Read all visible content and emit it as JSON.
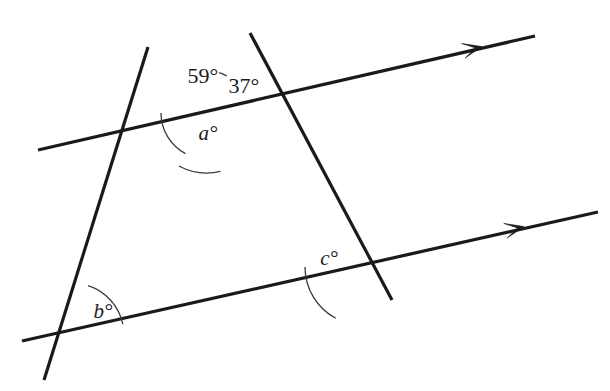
{
  "diagram": {
    "background_color": "#ffffff",
    "line_color": "#1a1a1a",
    "arc_color": "#3a3a3a",
    "width": 610,
    "height": 391,
    "lines": [
      {
        "name": "upper-parallel-line",
        "x1": 38,
        "y1": 150,
        "x2": 535,
        "y2": 36,
        "arrow_at": {
          "x": 480,
          "y": 47
        },
        "arrow_count": 1
      },
      {
        "name": "lower-parallel-line",
        "x1": 22,
        "y1": 341,
        "x2": 598,
        "y2": 212,
        "arrow_at": {
          "x": 522,
          "y": 227
        },
        "arrow_count": 1
      },
      {
        "name": "left-transversal-line",
        "x1": 148,
        "y1": 47,
        "x2": 44,
        "y2": 380,
        "arrow_at": null,
        "arrow_count": 0
      },
      {
        "name": "right-transversal-line",
        "x1": 250,
        "y1": 33,
        "x2": 392,
        "y2": 300,
        "arrow_at": null,
        "arrow_count": 0
      }
    ],
    "vertices": [
      {
        "name": "top-intersection",
        "x": 207,
        "y": 113
      },
      {
        "name": "bottom-left-intersection",
        "x": 72,
        "y": 335
      },
      {
        "name": "bottom-right-intersection",
        "x": 363,
        "y": 267
      }
    ],
    "angles": [
      {
        "name": "angle-59",
        "label": "59°",
        "value": 59,
        "kind": "numeric",
        "label_x": 203,
        "label_y": 78,
        "vertex": {
          "x": 207,
          "y": 113
        },
        "arc_radius": 46,
        "arc_start_deg": 180,
        "arc_end_deg": 118
      },
      {
        "name": "angle-37",
        "label": "37°",
        "value": 37,
        "kind": "numeric",
        "label_x": 244,
        "label_y": 88,
        "vertex": {
          "x": 207,
          "y": 113
        },
        "arc_radius": 60,
        "arc_start_deg": 118,
        "arc_end_deg": 77
      },
      {
        "name": "angle-a",
        "label": "a°",
        "value": null,
        "kind": "variable",
        "label_x": 208,
        "label_y": 135,
        "vertex": {
          "x": 207,
          "y": 113
        },
        "arc_radius": 42,
        "arc_start_deg": -62,
        "arc_end_deg": -103
      },
      {
        "name": "angle-b",
        "label": "b°",
        "value": null,
        "kind": "variable",
        "label_x": 103,
        "label_y": 313,
        "vertex": {
          "x": 72,
          "y": 335
        },
        "arc_radius": 52,
        "arc_start_deg": -12,
        "arc_end_deg": -72
      },
      {
        "name": "angle-c",
        "label": "c°",
        "value": null,
        "kind": "variable",
        "label_x": 329,
        "label_y": 260,
        "vertex": {
          "x": 363,
          "y": 267
        },
        "arc_radius": 58,
        "arc_start_deg": 180,
        "arc_end_deg": 118
      }
    ],
    "parallel_marks": {
      "symbol": "single-arrow",
      "count": 2
    }
  }
}
